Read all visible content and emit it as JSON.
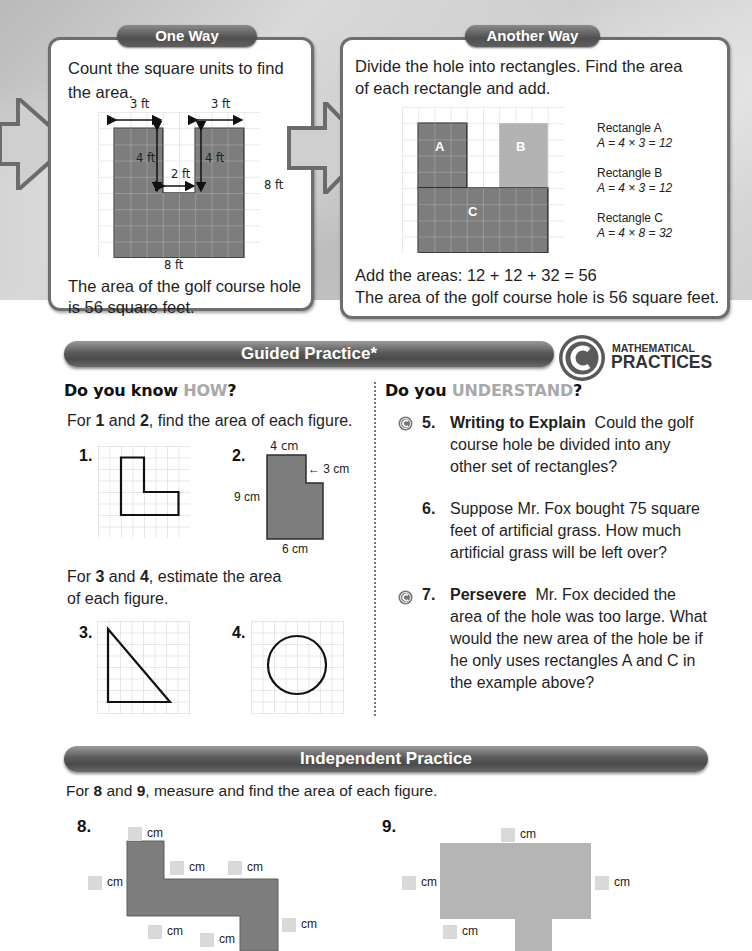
{
  "one_way": {
    "tab": "One Way",
    "intro_line1": "Count the square units to find",
    "intro_line2": "the area.",
    "labels": {
      "top_left": "3 ft",
      "top_right": "3 ft",
      "left_inner": "4 ft",
      "right_inner": "4 ft",
      "gap": "2 ft",
      "right_side": "8 ft",
      "bottom": "8 ft"
    },
    "conclusion_line1": "The area of the golf course hole",
    "conclusion_line2": "is 56 square feet."
  },
  "another_way": {
    "tab": "Another Way",
    "intro_line1": "Divide the hole into rectangles. Find the area",
    "intro_line2": "of each rectangle and add.",
    "rect_labels": {
      "a": "A",
      "b": "B",
      "c": "C"
    },
    "rectangles": [
      {
        "name": "Rectangle A",
        "formula": "A = 4 × 3 = 12"
      },
      {
        "name": "Rectangle B",
        "formula": "A = 4 × 3 = 12"
      },
      {
        "name": "Rectangle C",
        "formula": "A = 4 × 8 = 32"
      }
    ],
    "sum_line": "Add the areas: 12 + 12 + 32 = 56",
    "conclusion": "The area of the golf course hole is 56 square feet."
  },
  "guided_practice": {
    "title": "Guided Practice*",
    "mp_logo_top": "MATHEMATICAL",
    "mp_logo_bottom": "PRACTICES",
    "how": {
      "heading_prefix": "Do you know ",
      "heading_highlight": "HOW",
      "heading_suffix": "?",
      "instr1_pre": "For ",
      "instr1_n1": "1",
      "instr1_mid": " and ",
      "instr1_n2": "2",
      "instr1_post": ", find the area of each figure.",
      "q1": "1.",
      "q2": "2.",
      "q2_labels": {
        "top": "4 cm",
        "notch": "3 cm",
        "left": "9 cm",
        "bottom": "6 cm"
      },
      "instr2_pre": "For ",
      "instr2_n1": "3",
      "instr2_mid": " and ",
      "instr2_n2": "4",
      "instr2_post": ", estimate the area",
      "instr2_line2": "of each figure.",
      "q3": "3.",
      "q4": "4."
    },
    "understand": {
      "heading_prefix": "Do you ",
      "heading_highlight": "UNDERSTAND",
      "heading_suffix": "?",
      "questions": [
        {
          "num": "5.",
          "title": "Writing to Explain",
          "lines": [
            "Could the golf",
            "course hole be divided into any",
            "other set of rectangles?"
          ],
          "mp_icon": true
        },
        {
          "num": "6.",
          "title": "",
          "lines": [
            "Suppose Mr. Fox bought 75 square",
            "feet of artificial grass. How much",
            "artificial grass will be left over?"
          ],
          "mp_icon": false
        },
        {
          "num": "7.",
          "title": "Persevere",
          "lines": [
            "Mr. Fox decided the",
            "area of the hole was too large. What",
            "would the new area of the hole be if",
            "he only uses rectangles A and C in",
            "the example above?"
          ],
          "mp_icon": true
        }
      ]
    }
  },
  "independent_practice": {
    "title": "Independent Practice",
    "instr_pre": "For ",
    "instr_n1": "8",
    "instr_mid": " and ",
    "instr_n2": "9",
    "instr_post": ", measure and find the area of each figure.",
    "q8": "8.",
    "q9": "9.",
    "unit": "cm"
  },
  "colors": {
    "shape_fill": "#7d7d7d",
    "shape_fill_light": "#b3b3b3",
    "bar_dark": "#4f4f4f",
    "grid_line": "#d4d4d4"
  }
}
